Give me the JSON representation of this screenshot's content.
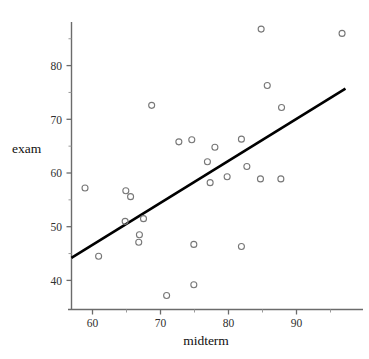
{
  "chart_data": {
    "type": "scatter",
    "title": "",
    "subtitle": "",
    "xlabel": "midterm",
    "ylabel": "exam",
    "xlim": [
      56.8,
      97.5
    ],
    "ylim": [
      37.0,
      87.6
    ],
    "grid": false,
    "legend": null,
    "xticks": [
      60,
      70,
      80,
      90
    ],
    "xtick_labels": [
      "60",
      "70",
      "80",
      "90"
    ],
    "yticks": [
      40,
      50,
      60,
      70,
      80
    ],
    "ytick_labels": [
      "40",
      "50",
      "60",
      "70",
      "80"
    ],
    "x_minor_ticks": [
      65,
      75,
      85,
      95
    ],
    "y_minor_ticks": [
      45,
      55,
      65,
      75,
      85
    ],
    "marker": "open-circle",
    "marker_color": "#777777",
    "marker_size": 3.0,
    "points": [
      {
        "x": 58.9,
        "y": 57.2
      },
      {
        "x": 60.9,
        "y": 44.5
      },
      {
        "x": 64.9,
        "y": 56.7
      },
      {
        "x": 65.6,
        "y": 55.6
      },
      {
        "x": 64.8,
        "y": 51.0
      },
      {
        "x": 67.5,
        "y": 51.5
      },
      {
        "x": 66.9,
        "y": 48.5
      },
      {
        "x": 66.8,
        "y": 47.1
      },
      {
        "x": 68.7,
        "y": 72.6
      },
      {
        "x": 70.9,
        "y": 37.2
      },
      {
        "x": 72.7,
        "y": 65.8
      },
      {
        "x": 74.6,
        "y": 66.2
      },
      {
        "x": 74.9,
        "y": 46.7
      },
      {
        "x": 74.9,
        "y": 39.2
      },
      {
        "x": 76.9,
        "y": 62.1
      },
      {
        "x": 77.3,
        "y": 58.2
      },
      {
        "x": 78.0,
        "y": 64.8
      },
      {
        "x": 79.8,
        "y": 59.3
      },
      {
        "x": 81.9,
        "y": 66.3
      },
      {
        "x": 81.9,
        "y": 46.3
      },
      {
        "x": 82.7,
        "y": 61.2
      },
      {
        "x": 84.7,
        "y": 58.9
      },
      {
        "x": 84.8,
        "y": 86.8
      },
      {
        "x": 85.7,
        "y": 76.3
      },
      {
        "x": 87.8,
        "y": 72.2
      },
      {
        "x": 87.7,
        "y": 58.9
      },
      {
        "x": 96.7,
        "y": 86.0
      }
    ],
    "fit_line": {
      "name": "least-squares regression line",
      "color": "#000000",
      "width": 2.6,
      "x_start": 56.9,
      "y_start": 44.2,
      "x_end": 97.2,
      "y_end": 75.7
    }
  },
  "axes": {
    "x_axis_name": "midterm-axis",
    "y_axis_name": "exam-axis",
    "axis_color": "#6b6b6b"
  },
  "labels": {
    "x_title": "midterm",
    "y_title": "exam"
  }
}
